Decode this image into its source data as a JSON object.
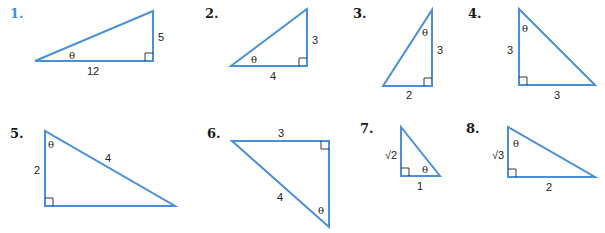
{
  "colors": {
    "triangle_stroke": "#4a90d9",
    "first_number": "#3d8fd6",
    "text": "#222222"
  },
  "problems": [
    {
      "number": "1.",
      "sides": {
        "a": "5",
        "b": "12"
      },
      "angle": "θ"
    },
    {
      "number": "2.",
      "sides": {
        "a": "3",
        "b": "4"
      },
      "angle": "θ"
    },
    {
      "number": "3.",
      "sides": {
        "a": "3",
        "b": "2"
      },
      "angle": "θ"
    },
    {
      "number": "4.",
      "sides": {
        "a": "3",
        "b": "3"
      },
      "angle": "θ"
    },
    {
      "number": "5.",
      "sides": {
        "a": "2",
        "b": "4"
      },
      "angle": "θ"
    },
    {
      "number": "6.",
      "sides": {
        "a": "3",
        "b": "4"
      },
      "angle": "θ"
    },
    {
      "number": "7.",
      "sides": {
        "a": "√2",
        "b": "1"
      },
      "angle": "θ"
    },
    {
      "number": "8.",
      "sides": {
        "a": "√3",
        "b": "2"
      },
      "angle": "θ"
    }
  ]
}
